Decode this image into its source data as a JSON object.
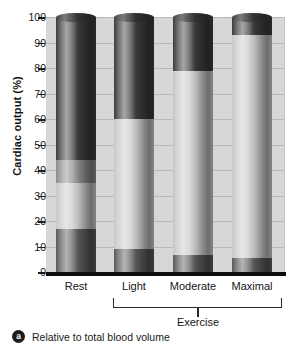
{
  "chart_data": {
    "type": "bar",
    "title": "",
    "subtitle": "",
    "xlabel": "",
    "ylabel": "Cardiac output (%)",
    "ylim": [
      0,
      100
    ],
    "yticks": [
      0,
      10,
      20,
      30,
      40,
      50,
      60,
      70,
      80,
      90,
      100
    ],
    "ytick_labels": [
      "0",
      "10",
      "20",
      "30",
      "40",
      "50",
      "60",
      "70",
      "80",
      "90",
      "100"
    ],
    "grid": true,
    "grid_axis": "y",
    "legend": false,
    "legend_position": "none",
    "stacked": true,
    "categories": [
      "Rest",
      "Light",
      "Moderate",
      "Maximal"
    ],
    "group_bracket": {
      "label": "Exercise",
      "covers": [
        "Light",
        "Moderate",
        "Maximal"
      ]
    },
    "series": [
      {
        "name": "Other organs (dark base)",
        "color": "#5a5a5a",
        "values": [
          17,
          9,
          6.5,
          5.5
        ]
      },
      {
        "name": "Mid band (light gray)",
        "color": "#c8c8c8",
        "values": [
          18,
          51,
          72.5,
          87.5
        ]
      },
      {
        "name": "Upper band (medium gray)",
        "color": "#8c8c8c",
        "values": [
          9,
          0,
          0,
          0
        ]
      },
      {
        "name": "Top band (darkest)",
        "color": "#3c3c3c",
        "values": [
          56,
          40,
          21,
          7
        ]
      }
    ],
    "segment_boundaries": {
      "Rest": [
        0,
        17,
        35,
        44,
        100
      ],
      "Light": [
        0,
        9,
        60,
        60,
        100
      ],
      "Moderate": [
        0,
        6.5,
        79,
        79,
        100
      ],
      "Maximal": [
        0,
        5.5,
        93,
        93,
        100
      ]
    },
    "annotations": []
  },
  "figure": {
    "y_axis_title": "Cardiac output (%)",
    "footnote": {
      "badge": "a",
      "text": "Relative to total blood volume"
    }
  },
  "colors": {
    "plot_background": "#d7d7d7",
    "gridline": "#b9b9b9",
    "baseline": "#0d0d0d",
    "text": "#151515",
    "page_background": "#ffffff"
  }
}
